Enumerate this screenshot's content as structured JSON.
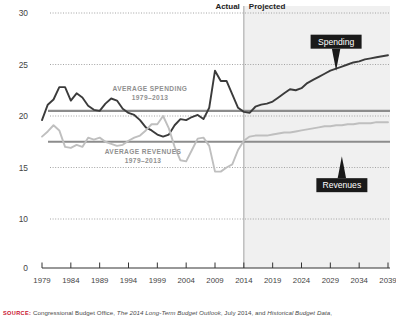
{
  "chart_data": {
    "type": "line",
    "title": "",
    "xlabel": "",
    "ylabel": "",
    "unit_note": "Percentage of Gross Domestic Product",
    "xlim": [
      1979,
      2039
    ],
    "ylim": [
      10,
      30
    ],
    "axis_break_below": 10,
    "grid": "horizontal dotted",
    "y_ticks": [
      "30",
      "25",
      "20",
      "15",
      "10",
      "0"
    ],
    "y_tick_values": [
      30,
      25,
      20,
      15,
      10,
      0
    ],
    "x_ticks": [
      "1979",
      "1984",
      "1989",
      "1994",
      "1999",
      "2004",
      "2009",
      "2014",
      "2019",
      "2024",
      "2029",
      "2034",
      "2039"
    ],
    "x_tick_values": [
      1979,
      1984,
      1989,
      1994,
      1999,
      2004,
      2009,
      2014,
      2019,
      2024,
      2029,
      2034,
      2039
    ],
    "x": [
      1979,
      1980,
      1981,
      1982,
      1983,
      1984,
      1985,
      1986,
      1987,
      1988,
      1989,
      1990,
      1991,
      1992,
      1993,
      1994,
      1995,
      1996,
      1997,
      1998,
      1999,
      2000,
      2001,
      2002,
      2003,
      2004,
      2005,
      2006,
      2007,
      2008,
      2009,
      2010,
      2011,
      2012,
      2013,
      2014,
      2015,
      2016,
      2017,
      2018,
      2019,
      2020,
      2021,
      2022,
      2023,
      2024,
      2025,
      2026,
      2027,
      2028,
      2029,
      2030,
      2031,
      2032,
      2033,
      2034,
      2035,
      2036,
      2037,
      2038,
      2039
    ],
    "series": [
      {
        "name": "Spending",
        "color": "#3b3b3b",
        "values": [
          19.6,
          21.1,
          21.6,
          22.8,
          22.8,
          21.5,
          22.2,
          21.8,
          21.0,
          20.6,
          20.5,
          21.2,
          21.7,
          21.5,
          20.7,
          20.3,
          20.1,
          19.6,
          18.9,
          18.6,
          18.2,
          18.0,
          18.2,
          19.1,
          19.7,
          19.6,
          19.9,
          20.1,
          19.7,
          20.8,
          24.4,
          23.4,
          23.4,
          22.1,
          20.8,
          20.4,
          20.3,
          20.9,
          21.1,
          21.2,
          21.4,
          21.8,
          22.2,
          22.6,
          22.5,
          22.7,
          23.2,
          23.5,
          23.8,
          24.1,
          24.4,
          24.6,
          24.8,
          25.0,
          25.2,
          25.3,
          25.5,
          25.6,
          25.7,
          25.8,
          25.9
        ]
      },
      {
        "name": "Revenues",
        "color": "#bfbfbf",
        "values": [
          18.0,
          18.5,
          19.1,
          18.6,
          17.0,
          16.9,
          17.2,
          17.0,
          17.9,
          17.7,
          17.9,
          17.5,
          17.3,
          17.1,
          17.2,
          17.6,
          17.9,
          18.1,
          18.6,
          19.2,
          19.2,
          20.0,
          18.8,
          17.0,
          15.7,
          15.6,
          16.7,
          17.8,
          17.9,
          17.1,
          14.6,
          14.6,
          15.0,
          15.3,
          16.7,
          17.6,
          18.0,
          18.1,
          18.1,
          18.1,
          18.2,
          18.3,
          18.4,
          18.4,
          18.5,
          18.6,
          18.7,
          18.8,
          18.9,
          19.0,
          19.0,
          19.1,
          19.1,
          19.2,
          19.2,
          19.3,
          19.3,
          19.3,
          19.4,
          19.4,
          19.4
        ]
      }
    ],
    "reference_lines": [
      {
        "name": "Average Spending 1979-2013",
        "value": 20.5,
        "color": "#8c8c8c",
        "label_line1": "AVERAGE SPENDING",
        "label_line2": "1979–2013"
      },
      {
        "name": "Average Revenues 1979-2013",
        "value": 17.5,
        "color": "#8c8c8c",
        "label_line1": "AVERAGE REVENUES",
        "label_line2": "1979–2013"
      }
    ],
    "divider": {
      "value": 2014,
      "left_label": "Actual",
      "right_label": "Projected",
      "shaded_side": "right",
      "shade_color": "#f0f0f0"
    },
    "callouts": [
      {
        "name": "Spending",
        "label": "Spending",
        "x": 2030,
        "y": 24.4,
        "bg": "#1a1a1a",
        "fg": "#ffffff",
        "pointer": "down"
      },
      {
        "name": "Revenues",
        "label": "Revenues",
        "x": 2031,
        "y": 16.1,
        "bg": "#1a1a1a",
        "fg": "#ffffff",
        "pointer": "up"
      }
    ],
    "legend_position": "in-plot callouts"
  },
  "source": {
    "label": "SOURCE:",
    "text_1": "Congressional Budget Office,",
    "italic_1": "The 2014 Long-Term Budget Outlook",
    "text_2": ", July 2014, and",
    "italic_2": "Historical Budget Data",
    "text_3": ","
  }
}
